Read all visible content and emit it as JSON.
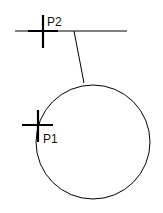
{
  "diagram": {
    "points": [
      {
        "label": "P2",
        "x": 43,
        "y": 31
      },
      {
        "label": "P1",
        "x": 38,
        "y": 125
      }
    ],
    "line": {
      "x1": 15,
      "y1": 31,
      "x2": 127,
      "y2": 31
    },
    "connector": {
      "x1": 74,
      "y1": 31,
      "x2": 84,
      "y2": 83
    },
    "circle": {
      "cx": 93,
      "cy": 142,
      "r": 57
    },
    "stroke_color": "#000000"
  }
}
